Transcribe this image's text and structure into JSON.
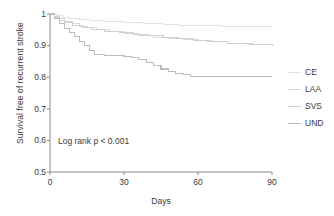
{
  "chart_data": {
    "type": "line",
    "subtype": "kaplan-meier-step",
    "title": "",
    "xlabel": "Days",
    "ylabel": "Survival free of recurrent stroke",
    "xlim": [
      0,
      90
    ],
    "ylim": [
      0.5,
      1.0
    ],
    "xticks": [
      0,
      30,
      60,
      90
    ],
    "yticks": [
      0.5,
      0.6,
      0.7,
      0.8,
      0.9,
      1
    ],
    "ytick_labels": [
      "0.5",
      "0.6",
      "0.7",
      "0.8",
      "0.9",
      "1"
    ],
    "xtick_labels": [
      "0",
      "30",
      "60",
      "90"
    ],
    "grid": false,
    "legend_position": "right",
    "annotation": "Log rank p < 0.001",
    "series": [
      {
        "name": "CE",
        "color": "#e2e2e2",
        "width": 1.0,
        "x": [
          0,
          1,
          3,
          5,
          8,
          12,
          16,
          22,
          30,
          38,
          46,
          52,
          60,
          70,
          80,
          90
        ],
        "y": [
          1.0,
          0.998,
          0.994,
          0.99,
          0.986,
          0.982,
          0.979,
          0.976,
          0.973,
          0.97,
          0.967,
          0.965,
          0.963,
          0.962,
          0.961,
          0.96
        ]
      },
      {
        "name": "LAA",
        "color": "#d9d9d9",
        "width": 1.0,
        "x": [
          0,
          2,
          4,
          6,
          9,
          12,
          15,
          19,
          24,
          30,
          36,
          42,
          48,
          54,
          60,
          66,
          72,
          80,
          90
        ],
        "y": [
          1.0,
          0.993,
          0.985,
          0.977,
          0.969,
          0.962,
          0.956,
          0.95,
          0.944,
          0.938,
          0.932,
          0.927,
          0.921,
          0.918,
          0.916,
          0.912,
          0.906,
          0.902,
          0.899
        ]
      },
      {
        "name": "SVS",
        "color": "#cfcfcf",
        "width": 1.0,
        "x": [
          0,
          2,
          4,
          6,
          9,
          13,
          17,
          22,
          28,
          34,
          40,
          46,
          52,
          58,
          64,
          72,
          82,
          90
        ],
        "y": [
          1.0,
          0.99,
          0.98,
          0.972,
          0.964,
          0.957,
          0.951,
          0.946,
          0.941,
          0.936,
          0.931,
          0.926,
          0.921,
          0.917,
          0.913,
          0.908,
          0.903,
          0.899
        ]
      },
      {
        "name": "UND",
        "color": "#bdbdbd",
        "width": 1.1,
        "x": [
          0,
          2,
          4,
          6,
          8,
          10,
          12,
          14,
          16,
          18,
          22,
          26,
          30,
          33,
          36,
          39,
          42,
          45,
          48,
          51,
          54,
          57,
          65,
          75,
          85,
          90
        ],
        "y": [
          1.0,
          0.985,
          0.97,
          0.955,
          0.942,
          0.928,
          0.914,
          0.9,
          0.884,
          0.872,
          0.87,
          0.868,
          0.866,
          0.862,
          0.855,
          0.846,
          0.836,
          0.826,
          0.818,
          0.812,
          0.808,
          0.803,
          0.802,
          0.802,
          0.802,
          0.802
        ]
      }
    ]
  },
  "axes": {
    "x_title": "Days",
    "y_title": "Survival free of recurrent stroke",
    "x_tick_0": "0",
    "x_tick_1": "30",
    "x_tick_2": "60",
    "x_tick_3": "90",
    "y_tick_0": "1",
    "y_tick_1": "0.9",
    "y_tick_2": "0.8",
    "y_tick_3": "0.7",
    "y_tick_4": "0.6",
    "y_tick_5": "0.5"
  },
  "annotation": {
    "text": "Log rank p < 0.001"
  },
  "legend": {
    "items": [
      {
        "label": "CE",
        "color": "#e2e2e2"
      },
      {
        "label": "LAA",
        "color": "#d9d9d9"
      },
      {
        "label": "SVS",
        "color": "#cfcfcf"
      },
      {
        "label": "UND",
        "color": "#bdbdbd"
      }
    ]
  },
  "style": {
    "axis_color": "#8a8a8a",
    "text_color": "#3a3a3a",
    "background": "#ffffff"
  }
}
